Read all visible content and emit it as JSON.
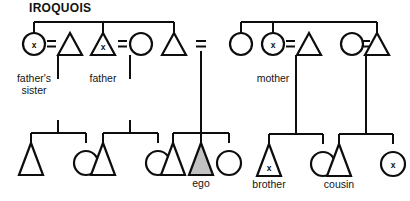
{
  "title": "IROQUOIS",
  "colors": {
    "line": "#0d0d0d",
    "background": "#ffffff",
    "ego_fill": "#c2c2c2",
    "shape_fill": "#ffffff"
  },
  "marks": {
    "x": "x",
    "equals": "="
  },
  "labels": {
    "fathers_sister": "father's\nsister",
    "father": "father",
    "ego": "ego",
    "mother": "mother",
    "brother": "brother",
    "cousin": "cousin"
  },
  "diagram": {
    "type": "kinship-chart",
    "system": "IROQUOIS",
    "generations": 2,
    "ego_symbol": "triangle",
    "ego_shading": "gray",
    "legend": {
      "triangle": "male",
      "circle": "female",
      "equals": "marriage",
      "x_mark": "same-term kin category"
    },
    "generation_1": [
      {
        "id": "g1-a",
        "shape": "circle",
        "marked": true,
        "label": "father's\nsister",
        "spouse_of": "g1-b"
      },
      {
        "id": "g1-b",
        "shape": "triangle",
        "marked": false,
        "label": ""
      },
      {
        "id": "g1-c",
        "shape": "triangle",
        "marked": true,
        "label": "father",
        "spouse_of": "g1-d"
      },
      {
        "id": "g1-d",
        "shape": "circle",
        "marked": false,
        "label": ""
      },
      {
        "id": "g1-e",
        "shape": "triangle",
        "marked": false,
        "label": ""
      },
      {
        "id": "g1-f",
        "shape": "circle",
        "marked": false,
        "label": ""
      },
      {
        "id": "g1-g",
        "shape": "circle",
        "marked": true,
        "label": "mother",
        "spouse_of": "g1-h"
      },
      {
        "id": "g1-h",
        "shape": "triangle",
        "marked": false,
        "label": ""
      },
      {
        "id": "g1-i",
        "shape": "circle",
        "marked": false,
        "label": "",
        "spouse_of": "g1-j"
      },
      {
        "id": "g1-j",
        "shape": "triangle",
        "marked": false,
        "label": ""
      }
    ],
    "generation_2": [
      {
        "id": "g2-a",
        "shape": "triangle",
        "marked": false,
        "label": ""
      },
      {
        "id": "g2-b",
        "shape": "circle",
        "marked": false,
        "label": ""
      },
      {
        "id": "g2-c",
        "shape": "triangle",
        "marked": false,
        "label": ""
      },
      {
        "id": "g2-d",
        "shape": "circle",
        "marked": false,
        "label": ""
      },
      {
        "id": "g2-e",
        "shape": "triangle",
        "marked": false,
        "label": ""
      },
      {
        "id": "g2-f",
        "shape": "triangle",
        "marked": false,
        "label": "ego",
        "shaded": true
      },
      {
        "id": "g2-g",
        "shape": "circle",
        "marked": false,
        "label": ""
      },
      {
        "id": "g2-h",
        "shape": "triangle",
        "marked": true,
        "label": "brother"
      },
      {
        "id": "g2-i",
        "shape": "circle",
        "marked": false,
        "label": ""
      },
      {
        "id": "g2-j",
        "shape": "triangle",
        "marked": false,
        "label": ""
      },
      {
        "id": "g2-k",
        "shape": "circle",
        "marked": true,
        "label": "cousin"
      }
    ],
    "sibling_sets": [
      {
        "members": [
          "g1-a",
          "g1-c",
          "g1-e"
        ],
        "note": "father's sibling set"
      },
      {
        "members": [
          "g1-f",
          "g1-g",
          "g1-i"
        ],
        "note": "mother's sibling set"
      }
    ],
    "marriages": [
      {
        "pair": [
          "g1-a",
          "g1-b"
        ]
      },
      {
        "pair": [
          "g1-c",
          "g1-d"
        ]
      },
      {
        "pair": [
          "g1-e",
          "g1-f"
        ]
      },
      {
        "pair": [
          "g1-g",
          "g1-h"
        ]
      },
      {
        "pair": [
          "g1-i",
          "g1-j"
        ]
      }
    ]
  }
}
